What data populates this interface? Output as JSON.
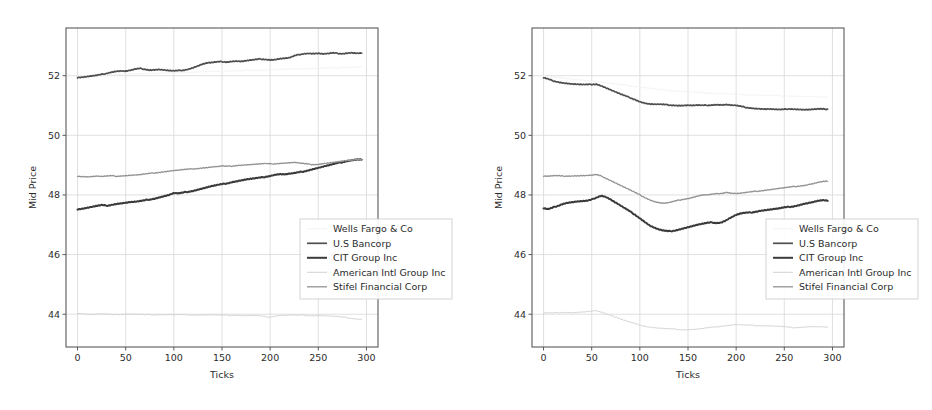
{
  "figure": {
    "width": 932,
    "height": 410,
    "background": "#ffffff",
    "panel_count": 2
  },
  "style": {
    "axis_color": "#5a5a5a",
    "grid_color": "#d8d8d8",
    "text_color": "#2b2b2b",
    "legend_border": "#c8c8c8",
    "legend_background": "#ffffff"
  },
  "series_style": {
    "Wells Fargo & Co": {
      "color": "#f3f3f3",
      "width": 1.0
    },
    "U.S Bancorp": {
      "color": "#4f4f4f",
      "width": 1.7
    },
    "CIT Group Inc": {
      "color": "#3a3a3a",
      "width": 2.0
    },
    "American Intl Group Inc": {
      "color": "#d3d3d3",
      "width": 1.0
    },
    "Stifel Financial Corp": {
      "color": "#939393",
      "width": 1.3
    }
  },
  "legend": {
    "entries": [
      {
        "label": "Wells Fargo & Co",
        "swatch": "#f3f3f3"
      },
      {
        "label": "U.S Bancorp",
        "swatch": "#4f4f4f"
      },
      {
        "label": "CIT Group Inc",
        "swatch": "#3a3a3a"
      },
      {
        "label": "American Intl Group Inc",
        "swatch": "#d3d3d3"
      },
      {
        "label": "Stifel Financial Corp",
        "swatch": "#939393"
      }
    ]
  },
  "chart_data": [
    {
      "type": "line",
      "panel": "left",
      "title": "",
      "xlabel": "Ticks",
      "ylabel": "Mid Price",
      "xlim": [
        -12,
        312
      ],
      "ylim": [
        42.9,
        53.6
      ],
      "xticks": [
        0,
        50,
        100,
        150,
        200,
        250,
        300
      ],
      "yticks": [
        44,
        46,
        48,
        50,
        52
      ],
      "grid": true,
      "legend_position": "lower right",
      "x": [
        0,
        5,
        10,
        15,
        20,
        25,
        30,
        35,
        40,
        45,
        50,
        55,
        60,
        65,
        70,
        75,
        80,
        85,
        90,
        95,
        100,
        105,
        110,
        115,
        120,
        125,
        130,
        135,
        140,
        145,
        150,
        155,
        160,
        165,
        170,
        175,
        180,
        185,
        190,
        195,
        200,
        205,
        210,
        215,
        220,
        225,
        230,
        235,
        240,
        245,
        250,
        255,
        260,
        265,
        270,
        275,
        280,
        285,
        290,
        295
      ],
      "series": [
        {
          "name": "Wells Fargo & Co",
          "values": [
            52.0,
            52.01,
            52.0,
            52.02,
            52.01,
            52.03,
            52.02,
            52.04,
            52.03,
            52.05,
            52.04,
            52.06,
            52.05,
            52.07,
            52.06,
            52.08,
            52.07,
            52.09,
            52.08,
            52.1,
            52.09,
            52.11,
            52.1,
            52.12,
            52.11,
            52.13,
            52.12,
            52.14,
            52.13,
            52.15,
            52.14,
            52.16,
            52.15,
            52.17,
            52.16,
            52.18,
            52.17,
            52.19,
            52.18,
            52.2,
            52.19,
            52.21,
            52.2,
            52.22,
            52.21,
            52.23,
            52.22,
            52.24,
            52.23,
            52.25,
            52.24,
            52.26,
            52.25,
            52.27,
            52.26,
            52.28,
            52.27,
            52.29,
            52.28,
            52.3
          ]
        },
        {
          "name": "U.S Bancorp",
          "values": [
            51.94,
            51.95,
            51.97,
            51.99,
            52.01,
            52.04,
            52.08,
            52.12,
            52.15,
            52.16,
            52.15,
            52.18,
            52.22,
            52.24,
            52.22,
            52.19,
            52.2,
            52.21,
            52.19,
            52.17,
            52.16,
            52.17,
            52.19,
            52.22,
            52.27,
            52.33,
            52.39,
            52.43,
            52.44,
            52.46,
            52.47,
            52.46,
            52.48,
            52.49,
            52.48,
            52.5,
            52.52,
            52.54,
            52.56,
            52.55,
            52.53,
            52.54,
            52.57,
            52.58,
            52.6,
            52.66,
            52.71,
            52.74,
            52.75,
            52.74,
            52.75,
            52.73,
            52.74,
            52.76,
            52.75,
            52.74,
            52.76,
            52.77,
            52.75,
            52.76
          ]
        },
        {
          "name": "CIT Group Inc",
          "values": [
            47.52,
            47.54,
            47.57,
            47.6,
            47.63,
            47.66,
            47.64,
            47.67,
            47.7,
            47.72,
            47.74,
            47.76,
            47.77,
            47.79,
            47.82,
            47.85,
            47.88,
            47.92,
            47.96,
            48.0,
            48.06,
            48.05,
            48.08,
            48.11,
            48.14,
            48.18,
            48.22,
            48.26,
            48.3,
            48.33,
            48.36,
            48.39,
            48.43,
            48.46,
            48.49,
            48.52,
            48.54,
            48.56,
            48.58,
            48.61,
            48.64,
            48.68,
            48.7,
            48.69,
            48.71,
            48.73,
            48.76,
            48.79,
            48.83,
            48.87,
            48.91,
            48.95,
            48.99,
            49.03,
            49.07,
            49.1,
            49.14,
            49.17,
            49.19,
            49.19
          ]
        },
        {
          "name": "American Intl Group Inc",
          "values": [
            44.03,
            44.02,
            44.0,
            43.99,
            44.0,
            44.01,
            44.0,
            43.99,
            44.0,
            43.99,
            44.01,
            44.0,
            44.0,
            43.99,
            43.98,
            43.99,
            43.98,
            43.99,
            43.98,
            43.99,
            43.98,
            43.99,
            43.98,
            43.97,
            43.98,
            43.97,
            43.98,
            43.97,
            43.98,
            43.97,
            43.96,
            43.97,
            43.96,
            43.97,
            43.96,
            43.95,
            43.96,
            43.95,
            43.94,
            43.92,
            43.9,
            43.94,
            43.96,
            43.96,
            43.97,
            43.97,
            43.96,
            43.97,
            43.96,
            43.95,
            43.96,
            43.95,
            43.94,
            43.93,
            43.92,
            43.9,
            43.88,
            43.86,
            43.84,
            43.83
          ]
        },
        {
          "name": "Stifel Financial Corp",
          "values": [
            48.63,
            48.62,
            48.61,
            48.62,
            48.63,
            48.62,
            48.63,
            48.64,
            48.63,
            48.64,
            48.65,
            48.66,
            48.67,
            48.68,
            48.7,
            48.72,
            48.74,
            48.76,
            48.78,
            48.8,
            48.82,
            48.83,
            48.85,
            48.86,
            48.88,
            48.89,
            48.91,
            48.92,
            48.94,
            48.95,
            48.97,
            48.96,
            48.97,
            48.99,
            49.0,
            49.01,
            49.02,
            49.03,
            49.04,
            49.05,
            49.04,
            49.05,
            49.06,
            49.07,
            49.08,
            49.09,
            49.07,
            49.05,
            49.03,
            49.02,
            49.03,
            49.05,
            49.07,
            49.09,
            49.11,
            49.13,
            49.15,
            49.18,
            49.2,
            49.19
          ]
        }
      ]
    },
    {
      "type": "line",
      "panel": "right",
      "title": "",
      "xlabel": "Ticks",
      "ylabel": "Mid Price",
      "xlim": [
        -12,
        312
      ],
      "ylim": [
        42.9,
        53.6
      ],
      "xticks": [
        0,
        50,
        100,
        150,
        200,
        250,
        300
      ],
      "yticks": [
        44,
        46,
        48,
        50,
        52
      ],
      "grid": true,
      "legend_position": "lower right",
      "x": [
        0,
        5,
        10,
        15,
        20,
        25,
        30,
        35,
        40,
        45,
        50,
        55,
        60,
        65,
        70,
        75,
        80,
        85,
        90,
        95,
        100,
        105,
        110,
        115,
        120,
        125,
        130,
        135,
        140,
        145,
        150,
        155,
        160,
        165,
        170,
        175,
        180,
        185,
        190,
        195,
        200,
        205,
        210,
        215,
        220,
        225,
        230,
        235,
        240,
        245,
        250,
        255,
        260,
        265,
        270,
        275,
        280,
        285,
        290,
        295
      ],
      "series": [
        {
          "name": "Wells Fargo & Co",
          "values": [
            52.0,
            51.98,
            51.96,
            51.94,
            51.92,
            51.9,
            51.88,
            51.86,
            51.84,
            51.83,
            51.82,
            51.8,
            51.78,
            51.76,
            51.74,
            51.72,
            51.7,
            51.68,
            51.66,
            51.64,
            51.62,
            51.6,
            51.58,
            51.56,
            51.54,
            51.52,
            51.5,
            51.49,
            51.48,
            51.47,
            51.46,
            51.45,
            51.44,
            51.43,
            51.42,
            51.41,
            51.4,
            51.4,
            51.39,
            51.38,
            51.38,
            51.37,
            51.36,
            51.36,
            51.35,
            51.35,
            51.34,
            51.34,
            51.33,
            51.33,
            51.32,
            51.32,
            51.31,
            51.31,
            51.3,
            51.3,
            51.3,
            51.29,
            51.29,
            51.28
          ]
        },
        {
          "name": "U.S Bancorp",
          "values": [
            51.93,
            51.88,
            51.83,
            51.79,
            51.76,
            51.74,
            51.72,
            51.71,
            51.7,
            51.7,
            51.71,
            51.72,
            51.66,
            51.59,
            51.52,
            51.45,
            51.38,
            51.32,
            51.26,
            51.2,
            51.13,
            51.08,
            51.05,
            51.04,
            51.04,
            51.03,
            51.02,
            51.01,
            51.0,
            51.0,
            51.01,
            51.0,
            51.01,
            51.0,
            51.01,
            51.02,
            51.03,
            51.02,
            51.03,
            51.01,
            51.0,
            50.97,
            50.94,
            50.92,
            50.9,
            50.89,
            50.88,
            50.88,
            50.87,
            50.86,
            50.87,
            50.89,
            50.88,
            50.87,
            50.86,
            50.86,
            50.87,
            50.88,
            50.88,
            50.88
          ]
        },
        {
          "name": "CIT Group Inc",
          "values": [
            47.55,
            47.52,
            47.58,
            47.64,
            47.7,
            47.74,
            47.76,
            47.78,
            47.79,
            47.8,
            47.84,
            47.92,
            47.98,
            47.93,
            47.84,
            47.74,
            47.64,
            47.54,
            47.44,
            47.34,
            47.22,
            47.1,
            46.98,
            46.9,
            46.84,
            46.8,
            46.78,
            46.8,
            46.84,
            46.88,
            46.92,
            46.96,
            47.0,
            47.03,
            47.06,
            47.08,
            47.06,
            47.08,
            47.16,
            47.25,
            47.33,
            47.38,
            47.4,
            47.41,
            47.44,
            47.47,
            47.49,
            47.51,
            47.53,
            47.55,
            47.58,
            47.6,
            47.62,
            47.66,
            47.7,
            47.73,
            47.76,
            47.8,
            47.82,
            47.8
          ]
        },
        {
          "name": "American Intl Group Inc",
          "values": [
            44.04,
            44.04,
            44.04,
            44.05,
            44.06,
            44.06,
            44.05,
            44.06,
            44.07,
            44.08,
            44.1,
            44.12,
            44.08,
            44.02,
            43.96,
            43.9,
            43.84,
            43.78,
            43.73,
            43.68,
            43.64,
            43.6,
            43.57,
            43.55,
            43.53,
            43.52,
            43.51,
            43.5,
            43.49,
            43.48,
            43.48,
            43.49,
            43.5,
            43.52,
            43.54,
            43.56,
            43.58,
            43.6,
            43.62,
            43.64,
            43.65,
            43.64,
            43.63,
            43.63,
            43.62,
            43.62,
            43.61,
            43.61,
            43.6,
            43.59,
            43.58,
            43.56,
            43.55,
            43.56,
            43.57,
            43.58,
            43.58,
            43.58,
            43.57,
            43.56
          ]
        },
        {
          "name": "Stifel Financial Corp",
          "values": [
            48.63,
            48.63,
            48.64,
            48.64,
            48.63,
            48.64,
            48.64,
            48.64,
            48.65,
            48.65,
            48.66,
            48.68,
            48.63,
            48.56,
            48.48,
            48.4,
            48.32,
            48.24,
            48.16,
            48.08,
            48.0,
            47.92,
            47.84,
            47.78,
            47.74,
            47.72,
            47.74,
            47.78,
            47.82,
            47.86,
            47.88,
            47.92,
            47.96,
            48.0,
            48.0,
            48.02,
            48.04,
            48.06,
            48.09,
            48.06,
            48.05,
            48.06,
            48.08,
            48.1,
            48.12,
            48.14,
            48.16,
            48.18,
            48.2,
            48.22,
            48.24,
            48.26,
            48.28,
            48.3,
            48.32,
            48.35,
            48.38,
            48.42,
            48.45,
            48.46
          ]
        }
      ]
    }
  ]
}
